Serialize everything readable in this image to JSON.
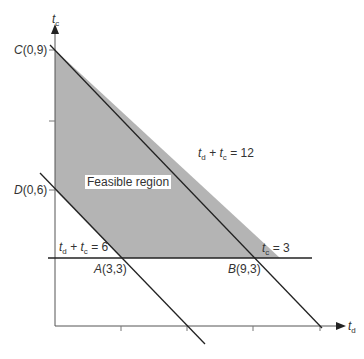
{
  "diagram": {
    "type": "linear-programming-feasible-region",
    "axes": {
      "x": {
        "var": "t",
        "sub": "d"
      },
      "y": {
        "var": "t",
        "sub": "c"
      }
    },
    "points": [
      {
        "name": "C",
        "coords": "(0,9)"
      },
      {
        "name": "D",
        "coords": "(0,6)"
      },
      {
        "name": "A",
        "coords": "(3,3)"
      },
      {
        "name": "B",
        "coords": "(9,3)"
      }
    ],
    "constraints": [
      {
        "lhs_a": "t",
        "sub_a": "d",
        "op": " + ",
        "lhs_b": "t",
        "sub_b": "c",
        "rhs": " = 12"
      },
      {
        "lhs_a": "t",
        "sub_a": "d",
        "op": " + ",
        "lhs_b": "t",
        "sub_b": "c",
        "rhs": " = 6"
      },
      {
        "lhs": "t",
        "sub": "c",
        "rhs": " = 3"
      }
    ],
    "region_label": "Feasible region",
    "colors": {
      "region_fill": "#b4b4b4",
      "line": "#222222",
      "axis": "#555555"
    }
  }
}
